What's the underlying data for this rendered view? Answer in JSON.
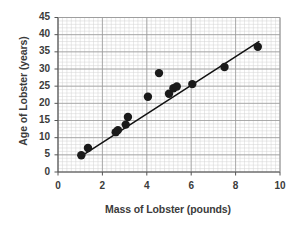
{
  "chart_data": {
    "type": "scatter",
    "title": "",
    "xlabel": "Mass of Lobster (pounds)",
    "ylabel": "Age of Lobster (years)",
    "xlim": [
      0,
      10
    ],
    "ylim": [
      0,
      45
    ],
    "xticks": [
      0,
      2,
      4,
      6,
      8,
      10
    ],
    "yticks": [
      0,
      5,
      10,
      15,
      20,
      25,
      30,
      35,
      40,
      45
    ],
    "xtick_labels": [
      "0",
      "2",
      "4",
      "6",
      "8",
      "10"
    ],
    "ytick_labels": [
      "0",
      "5",
      "10",
      "15",
      "20",
      "25",
      "30",
      "35",
      "40",
      "45"
    ],
    "grid": true,
    "minor_grid": true,
    "x_minor_step": 0.2,
    "y_minor_step": 1,
    "legend": "none",
    "marker": "filled-circle",
    "marker_color": "#1a1a1a",
    "point_count": 13,
    "points": [
      {
        "x": 1.05,
        "y": 4.9
      },
      {
        "x": 1.35,
        "y": 7.0
      },
      {
        "x": 2.6,
        "y": 11.6
      },
      {
        "x": 2.7,
        "y": 12.2
      },
      {
        "x": 3.05,
        "y": 13.8
      },
      {
        "x": 3.15,
        "y": 16.0
      },
      {
        "x": 4.05,
        "y": 21.9
      },
      {
        "x": 4.55,
        "y": 28.8
      },
      {
        "x": 5.0,
        "y": 22.8
      },
      {
        "x": 5.2,
        "y": 24.4
      },
      {
        "x": 5.35,
        "y": 24.9
      },
      {
        "x": 6.05,
        "y": 25.6
      },
      {
        "x": 7.5,
        "y": 30.6
      },
      {
        "x": 9.0,
        "y": 36.5
      }
    ],
    "trendline": {
      "type": "linear",
      "x_start": 1.0,
      "y_start": 4.4,
      "x_end": 9.05,
      "y_end": 38.0,
      "color": "#111111"
    },
    "colors": {
      "axis": "#555555",
      "major_grid": "#9a9a9a",
      "minor_grid": "#d2d2d2",
      "text": "#3b3b3b",
      "background": "#ffffff"
    }
  }
}
